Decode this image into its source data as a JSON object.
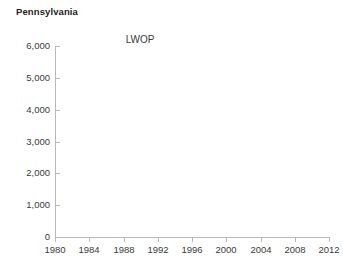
{
  "chart_data": {
    "type": "line",
    "title": "Pennsylvania",
    "subtitle": "LWOP",
    "xlabel": "",
    "ylabel": "",
    "xlim": [
      1980,
      2012
    ],
    "ylim": [
      0,
      6000
    ],
    "grid": false,
    "legend": null,
    "x_ticks": [
      1980,
      1984,
      1988,
      1992,
      1996,
      2000,
      2004,
      2008,
      2012
    ],
    "x_tick_labels": [
      "1980",
      "1984",
      "1988",
      "1992",
      "1996",
      "2000",
      "2004",
      "2008",
      "2012"
    ],
    "y_ticks": [
      0,
      1000,
      2000,
      3000,
      4000,
      5000,
      6000
    ],
    "y_tick_labels": [
      "0",
      "1,000",
      "2,000",
      "3,000",
      "4,000",
      "5,000",
      "6,000"
    ],
    "series": [
      {
        "name": "LWOP",
        "x": [],
        "values": []
      }
    ],
    "annotations": []
  },
  "colors": {
    "axis_line": "#b8b8b8",
    "tick_text": "#3a3a3a",
    "title_text": "#231f20",
    "background": "#ffffff"
  }
}
